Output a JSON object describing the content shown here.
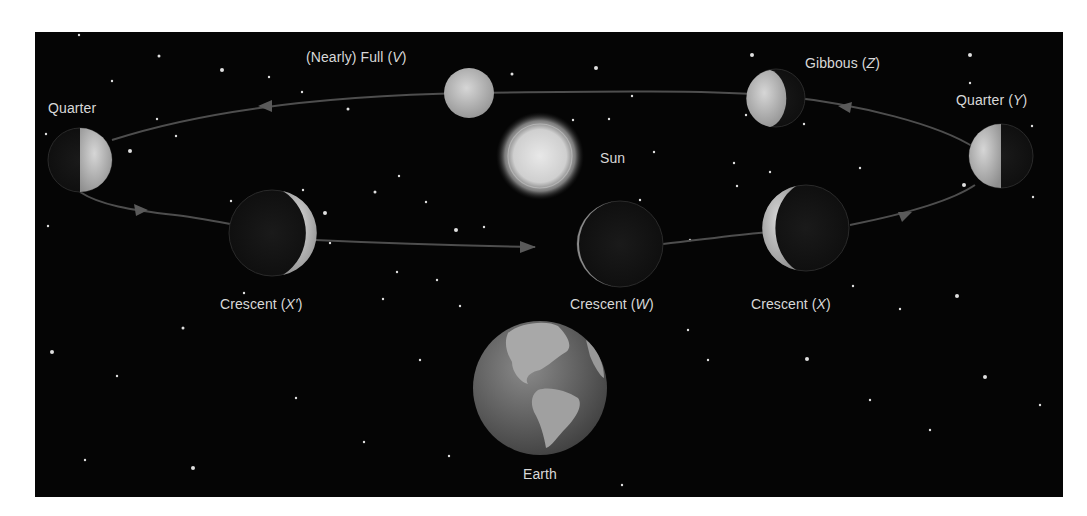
{
  "diagram": {
    "colors": {
      "background": "#050505",
      "frame": "#ffffff",
      "label": "#d8d8d8",
      "moon_lit": "#b8b8b8",
      "moon_dark": "#151515",
      "orbit": "#4a4a4a",
      "sun": "#d0d0d0"
    },
    "labels": {
      "quarter_left": "Quarter",
      "full": {
        "text": "(Nearly) Full (",
        "letter": "V",
        "close": ")"
      },
      "sun": "Sun",
      "gibbous": {
        "text": "Gibbous (",
        "letter": "Z",
        "close": ")"
      },
      "quarter_right": {
        "text": "Quarter (",
        "letter": "Y",
        "close": ")"
      },
      "crescent_xprime": {
        "text": "Crescent (",
        "letter": "X′",
        "close": ")"
      },
      "crescent_w": {
        "text": "Crescent (",
        "letter": "W",
        "close": ")"
      },
      "crescent_x": {
        "text": "Crescent (",
        "letter": "X",
        "close": ")"
      },
      "earth": "Earth"
    },
    "bodies": [
      {
        "id": "quarter-left",
        "phase": "quarter",
        "lit_side": "right"
      },
      {
        "id": "crescent-xprime",
        "phase": "crescent",
        "lit_side": "right"
      },
      {
        "id": "full-v",
        "phase": "nearly full"
      },
      {
        "id": "sun",
        "phase": "n/a"
      },
      {
        "id": "crescent-w",
        "phase": "thin crescent",
        "lit_side": "left"
      },
      {
        "id": "crescent-x",
        "phase": "crescent",
        "lit_side": "left"
      },
      {
        "id": "gibbous-z",
        "phase": "gibbous",
        "lit_side": "left"
      },
      {
        "id": "quarter-y",
        "phase": "quarter",
        "lit_side": "left"
      },
      {
        "id": "earth",
        "phase": "n/a"
      }
    ]
  }
}
